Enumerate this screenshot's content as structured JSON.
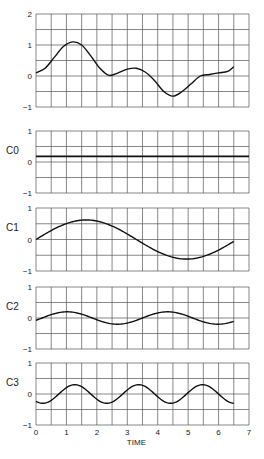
{
  "chart_data": {
    "type": "line",
    "title": "",
    "xlabel": "TIME",
    "x_ticks": [
      "0",
      "1",
      "2",
      "3",
      "4",
      "5",
      "6",
      "7"
    ],
    "xlim": [
      0,
      7
    ],
    "grid": true,
    "panels": [
      {
        "label": "",
        "ylim": [
          -1,
          2
        ],
        "y_ticks": [
          "2",
          "1",
          "0",
          "-1"
        ],
        "series": [
          {
            "name": "signal",
            "x": [
              0,
              0.3,
              0.6,
              0.9,
              1.2,
              1.5,
              1.8,
              2.1,
              2.4,
              2.7,
              3.0,
              3.3,
              3.6,
              3.9,
              4.2,
              4.5,
              4.8,
              5.1,
              5.4,
              5.7,
              6.0,
              6.3,
              6.5
            ],
            "values": [
              0.1,
              0.25,
              0.6,
              0.95,
              1.1,
              1.0,
              0.65,
              0.25,
              0.02,
              0.1,
              0.22,
              0.25,
              0.12,
              -0.15,
              -0.5,
              -0.65,
              -0.5,
              -0.25,
              0.0,
              0.05,
              0.1,
              0.15,
              0.3
            ]
          }
        ]
      },
      {
        "label": "C0",
        "ylim": [
          -1,
          1
        ],
        "y_ticks": [
          "1",
          "0",
          "-1"
        ],
        "series": [
          {
            "name": "C0",
            "x": [
              0,
              7
            ],
            "values": [
              0.18,
              0.18
            ]
          }
        ]
      },
      {
        "label": "C1",
        "ylim": [
          -1,
          1
        ],
        "y_ticks": [
          "1",
          "0",
          "-1"
        ],
        "series": [
          {
            "name": "C1",
            "amplitude": 0.62,
            "period": 6.6,
            "phase_zero_at": 0.0,
            "offset": 0,
            "x_end": 6.5
          }
        ]
      },
      {
        "label": "C2",
        "ylim": [
          -1,
          1
        ],
        "y_ticks": [
          "1",
          "0",
          "-1"
        ],
        "series": [
          {
            "name": "C2",
            "amplitude": 0.2,
            "period": 3.3,
            "phase_zero_at": 0.2,
            "offset": 0,
            "x_end": 6.5
          }
        ]
      },
      {
        "label": "C3",
        "ylim": [
          -1,
          1
        ],
        "y_ticks": [
          "1",
          "0",
          "-1"
        ],
        "series": [
          {
            "name": "C3",
            "amplitude": 0.3,
            "period": 2.1,
            "phase_zero_at": 0.75,
            "offset": 0,
            "x_end": 6.5
          }
        ]
      }
    ]
  }
}
